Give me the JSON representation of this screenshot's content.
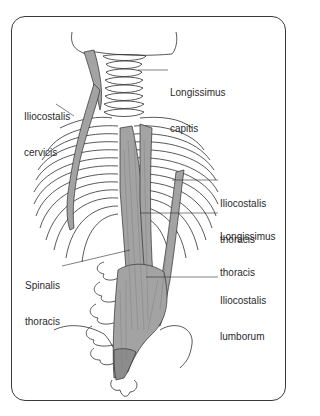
{
  "figure": {
    "colors": {
      "muscle": "#a3a3a3",
      "muscle_dark": "#8c8c8c",
      "outline": "#2e2e2e",
      "frame": "#3a3a3a"
    },
    "labels": [
      {
        "id": "longissimus-capitis",
        "line1": "Longissimus",
        "line2": "capitis"
      },
      {
        "id": "iliocostalis-cervicis",
        "line1": "Iliocostalis",
        "line2": "cervicis"
      },
      {
        "id": "iliocostalis-thoracis",
        "line1": "Iliocostalis",
        "line2": "thoracis"
      },
      {
        "id": "longissimus-thoracis",
        "line1": "Longissimus",
        "line2": "thoracis"
      },
      {
        "id": "spinalis-thoracis",
        "line1": "Spinalis",
        "line2": "thoracis"
      },
      {
        "id": "iliocostalis-lumborum",
        "line1": "Iliocostalis",
        "line2": "lumborum"
      }
    ]
  }
}
